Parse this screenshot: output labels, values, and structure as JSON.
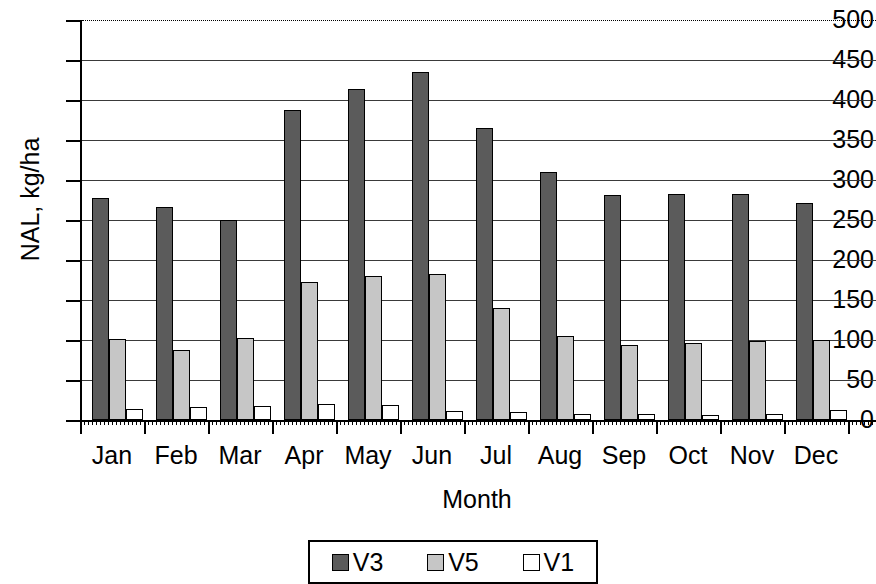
{
  "chart_data": {
    "type": "bar",
    "title": "",
    "xlabel": "Month",
    "ylabel": "NAL, kg/ha",
    "ylim": [
      0,
      500
    ],
    "yticks": [
      0,
      50,
      100,
      150,
      200,
      250,
      300,
      350,
      400,
      450,
      500
    ],
    "grid": true,
    "legend_position": "bottom",
    "categories": [
      "Jan",
      "Feb",
      "Mar",
      "Apr",
      "May",
      "Jun",
      "Jul",
      "Aug",
      "Sep",
      "Oct",
      "Nov",
      "Dec"
    ],
    "series": [
      {
        "name": "V3",
        "color": "#5b5b5b",
        "values": [
          277,
          266,
          250,
          388,
          414,
          435,
          365,
          310,
          281,
          282,
          283,
          271
        ]
      },
      {
        "name": "V5",
        "color": "#c6c6c6",
        "values": [
          101,
          87,
          102,
          172,
          180,
          183,
          140,
          105,
          94,
          96,
          99,
          100
        ]
      },
      {
        "name": "V1",
        "color": "#ffffff",
        "values": [
          14,
          16,
          17,
          20,
          19,
          11,
          10,
          7,
          7,
          6,
          8,
          12
        ]
      }
    ]
  },
  "axes": {
    "y_title": "NAL, kg/ha",
    "x_title": "Month",
    "y_tick_labels": [
      "500",
      "450",
      "400",
      "350",
      "300",
      "250",
      "200",
      "150",
      "100",
      "50",
      "0"
    ],
    "x_tick_labels": [
      "Jan",
      "Feb",
      "Mar",
      "Apr",
      "May",
      "Jun",
      "Jul",
      "Aug",
      "Sep",
      "Oct",
      "Nov",
      "Dec"
    ]
  },
  "legend": {
    "items": [
      {
        "label": "V3",
        "color": "#5b5b5b"
      },
      {
        "label": "V5",
        "color": "#c6c6c6"
      },
      {
        "label": "V1",
        "color": "#ffffff"
      }
    ]
  }
}
